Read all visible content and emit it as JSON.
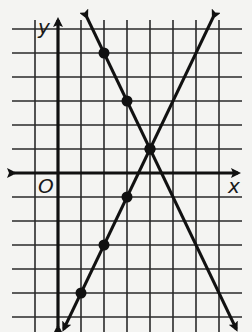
{
  "figure": {
    "x_axis_label": "x",
    "y_axis_label": "y",
    "origin_label": "O",
    "colors": {
      "background": "#f4f4f2",
      "grid": "#2a2a2a",
      "ink": "#111111"
    }
  },
  "chart_data": {
    "type": "line",
    "title": "",
    "xlabel": "x",
    "ylabel": "y",
    "grid": true,
    "xlim": [
      -2,
      7
    ],
    "ylim": [
      -6,
      6
    ],
    "series": [
      {
        "name": "decreasing line",
        "equation": "y = -2x + 9",
        "slope": -2,
        "intercept": 9,
        "points": [
          [
            2,
            5
          ],
          [
            3,
            3
          ],
          [
            4,
            1
          ]
        ],
        "arrows": "both ends"
      },
      {
        "name": "increasing line",
        "equation": "y = 2x - 7",
        "slope": 2,
        "intercept": -7,
        "points": [
          [
            1,
            -5
          ],
          [
            2,
            -3
          ],
          [
            3,
            -1
          ],
          [
            4,
            1
          ]
        ],
        "arrows": "both ends"
      }
    ],
    "intersection": [
      4,
      1
    ]
  }
}
